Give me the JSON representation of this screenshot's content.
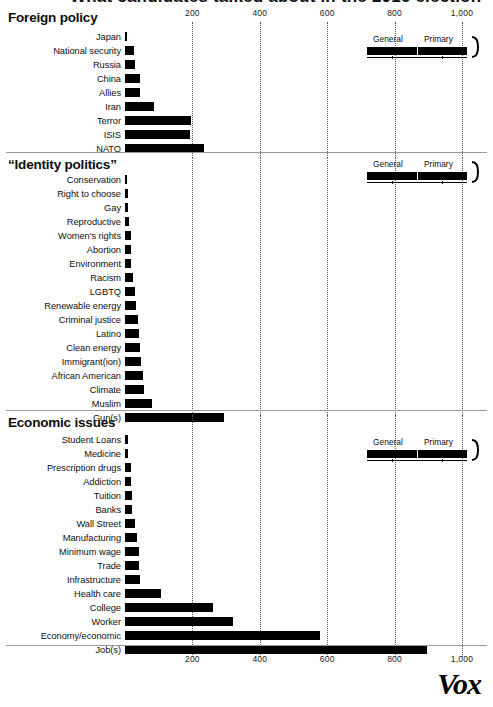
{
  "supertitle": "What candidates talked about in the 2016 election",
  "source_logo": "Vox",
  "axis": {
    "ticks": [
      200,
      400,
      600,
      800,
      1000
    ],
    "tick_labels": [
      "200",
      "400",
      "600",
      "800",
      "1,000"
    ],
    "min": 0,
    "max": 1000
  },
  "legend": {
    "general_label": "General",
    "primary_label": "Primary"
  },
  "chart_data": {
    "type": "bar",
    "orientation": "horizontal",
    "title": "What candidates talked about in the 2016 election",
    "xlabel": "",
    "ylabel": "",
    "xlim": [
      0,
      1000
    ],
    "grid": true,
    "gridlines_at": [
      200,
      400,
      600,
      800,
      1000
    ],
    "legend": [
      "General",
      "Primary"
    ],
    "legend_position": "top-right (per panel)",
    "panels": [
      {
        "title": "Foreign policy",
        "categories": [
          "Japan",
          "National security",
          "Russia",
          "China",
          "Allies",
          "Iran",
          "Terror",
          "ISIS",
          "NATO"
        ],
        "values": [
          7,
          27,
          30,
          44,
          45,
          85,
          195,
          193,
          235
        ]
      },
      {
        "title": "“Identity politics”",
        "categories": [
          "Conservation",
          "Right to choose",
          "Gay",
          "Reproductive",
          "Women's rights",
          "Abortion",
          "Environment",
          "Racism",
          "LGBTQ",
          "Renewable energy",
          "Criminal justice",
          "Latino",
          "Clean energy",
          "Immigrant(ion)",
          "African American",
          "Climate",
          "Muslim",
          "Gun(s)"
        ],
        "values": [
          2,
          9,
          9,
          12,
          18,
          18,
          19,
          24,
          30,
          33,
          38,
          41,
          44,
          47,
          52,
          56,
          80,
          293
        ]
      },
      {
        "title": "Economic issues",
        "categories": [
          "Student Loans",
          "Medicine",
          "Prescription drugs",
          "Addiction",
          "Tuition",
          "Banks",
          "Wall Street",
          "Manufacturing",
          "Minimum wage",
          "Trade",
          "Infrastructure",
          "Health care",
          "College",
          "Worker",
          "Economy/economic",
          "Job(s)"
        ],
        "values": [
          9,
          9,
          18,
          18,
          21,
          21,
          30,
          36,
          41,
          41,
          45,
          108,
          262,
          320,
          580,
          895
        ]
      }
    ]
  }
}
